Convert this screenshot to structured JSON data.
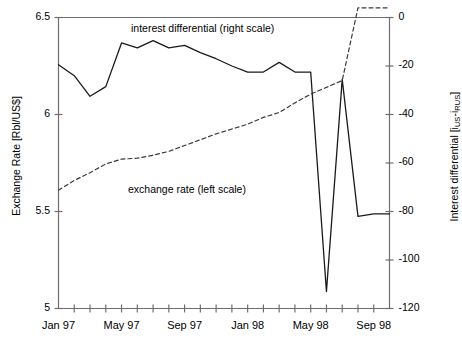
{
  "chart_data": {
    "type": "line",
    "title": "",
    "xlabel": "",
    "ylabel_left": "Exchange Rate [Rbl/US$]",
    "ylabel_right_prefix": "Interest differential [i",
    "ylabel_right_sub1": "US",
    "ylabel_right_mid": "-i",
    "ylabel_right_sub2": "RUS",
    "ylabel_right_suffix": "]",
    "ylabel_right_plain": "Interest differential [iUS-iRUS]",
    "grid": false,
    "legend_position": "inline-annotations",
    "annotations": [
      {
        "text": "interest differential (right scale)",
        "x_px": 131,
        "y_px": 22
      },
      {
        "text": "exchange rate (left scale)",
        "x_px": 128,
        "y_px": 183
      }
    ],
    "y_left": {
      "label": "Exchange Rate [Rbl/US$]",
      "ticks": [
        "6.5",
        "6",
        "5.5",
        "5"
      ],
      "tick_values": [
        6.5,
        6.0,
        5.5,
        5.0
      ],
      "lim": [
        5.0,
        6.5
      ]
    },
    "y_right": {
      "label": "Interest differential [iUS-iRUS]",
      "ticks": [
        "0",
        "-20",
        "-40",
        "-60",
        "-80",
        "-100",
        "-120"
      ],
      "tick_values": [
        0,
        -20,
        -40,
        -60,
        -80,
        -100,
        -120
      ],
      "lim": [
        -120,
        0
      ]
    },
    "x_axis": {
      "tick_labels": [
        "Jan 97",
        "May 97",
        "Sep 97",
        "Jan 98",
        "May 98",
        "Sep 98"
      ],
      "tick_label_indices": [
        0,
        4,
        8,
        12,
        16,
        20
      ],
      "minor_tick_count": 22,
      "x_index_range": [
        0,
        21
      ],
      "months": [
        "Jan 97",
        "Feb 97",
        "Mar 97",
        "Apr 97",
        "May 97",
        "Jun 97",
        "Jul 97",
        "Aug 97",
        "Sep 97",
        "Oct 97",
        "Nov 97",
        "Dec 97",
        "Jan 98",
        "Feb 98",
        "Mar 98",
        "Apr 98",
        "May 98",
        "Jun 98",
        "Jul 98",
        "Aug 98",
        "Sep 98",
        "Oct 98"
      ]
    },
    "series": [
      {
        "name": "interest differential (right scale)",
        "axis": "right",
        "style": "solid",
        "color": "#1a1a1a",
        "x": [
          0,
          1,
          2,
          3,
          4,
          5,
          6,
          7,
          8,
          9,
          10,
          11,
          12,
          13,
          14,
          15,
          16,
          17,
          18,
          19,
          20,
          21
        ],
        "values": [
          -19.5,
          -24.0,
          -32.5,
          -28.5,
          -10.5,
          -12.5,
          -9.5,
          -12.5,
          -11.5,
          -14.5,
          -17.0,
          -20.0,
          -22.5,
          -22.5,
          -18.5,
          -22.5,
          -22.5,
          -113.0,
          -25.5,
          -82.0,
          -81.0,
          -81.0
        ]
      },
      {
        "name": "exchange rate (left scale)",
        "axis": "left",
        "style": "dashed",
        "color": "#3a3a3a",
        "x": [
          0,
          1,
          2,
          3,
          4,
          5,
          6,
          7,
          8,
          9,
          10,
          11,
          12,
          13,
          14,
          15,
          16,
          17,
          18,
          19,
          20,
          21
        ],
        "values": [
          5.61,
          5.66,
          5.7,
          5.745,
          5.77,
          5.775,
          5.79,
          5.81,
          5.84,
          5.87,
          5.9,
          5.925,
          5.95,
          5.985,
          6.01,
          6.06,
          6.105,
          6.14,
          6.175,
          6.55,
          6.55,
          6.55
        ]
      }
    ]
  }
}
